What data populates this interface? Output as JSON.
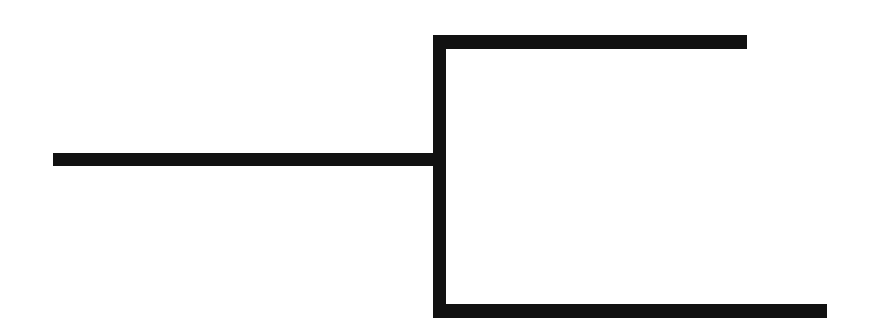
{
  "diagram": {
    "type": "tree-bracket",
    "stroke_color": "#111111",
    "background": "#ffffff",
    "segments": [
      {
        "id": "root-branch",
        "orientation": "horizontal",
        "x": 53,
        "y": 153,
        "w": 393,
        "h": 13
      },
      {
        "id": "trunk",
        "orientation": "vertical",
        "x": 433,
        "y": 35,
        "w": 13,
        "h": 283
      },
      {
        "id": "upper-branch",
        "orientation": "horizontal",
        "x": 433,
        "y": 35,
        "w": 314,
        "h": 14
      },
      {
        "id": "lower-branch",
        "orientation": "horizontal",
        "x": 433,
        "y": 304,
        "w": 394,
        "h": 14
      }
    ],
    "nodes": {
      "root": {
        "label": ""
      },
      "children": [
        {
          "label": ""
        },
        {
          "label": ""
        }
      ]
    }
  }
}
